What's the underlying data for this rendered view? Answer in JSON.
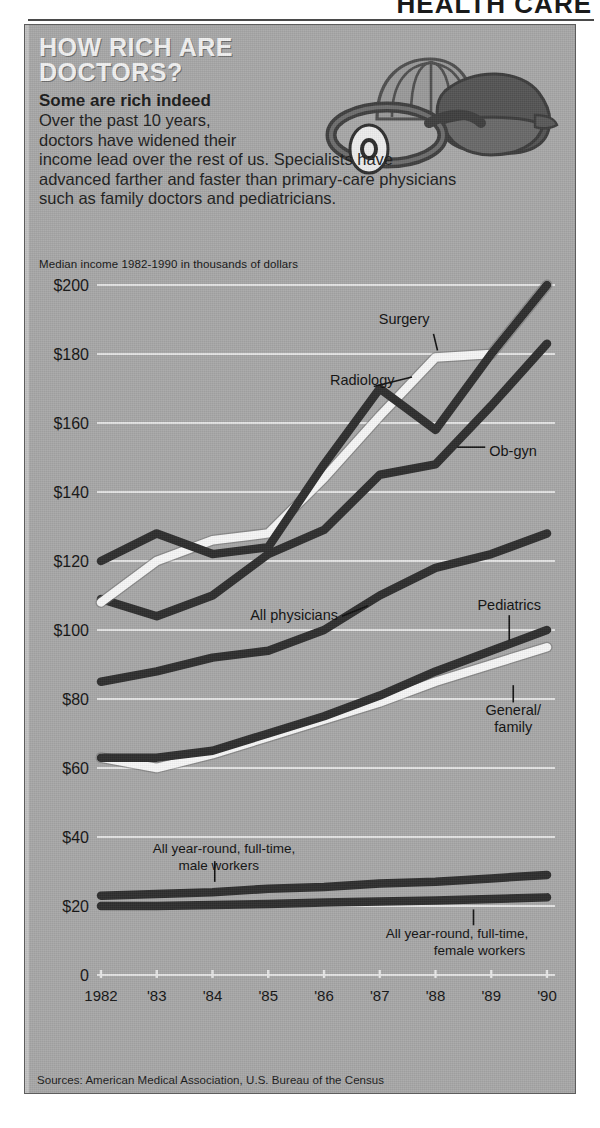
{
  "masthead": {
    "text": "HEALTH CARE"
  },
  "headline": {
    "line1": "HOW RICH ARE",
    "line2": "DOCTORS?"
  },
  "subhead": "Some are rich indeed",
  "deck": {
    "l1": "Over the past 10 years,",
    "l2": "doctors have widened their",
    "l3": "income lead over the rest of us.  Specialists have",
    "l4": "advanced farther and faster than primary-care physicians",
    "l5": "such as family doctors and pediatricians."
  },
  "chart_note": "Median income 1982-1990 in thousands of dollars",
  "sources": "Sources: American Medical Association, U.S. Bureau of the Census",
  "illustration": {
    "name": "stethoscope-and-doctors-bag"
  },
  "colors": {
    "panel_bg": "#a8a8a8",
    "dark_line": "#2e2e2e",
    "light_line": "#f7f7f7",
    "gridline": "#e8e8e8",
    "text": "#141414",
    "headline": "#f2f2f2"
  },
  "chart_data": {
    "type": "line",
    "title": "How rich are doctors?",
    "subtitle": "Median income 1982-1990 in thousands of dollars",
    "xlabel": "",
    "ylabel": "Median income (thousands of dollars)",
    "x": [
      1982,
      1983,
      1984,
      1985,
      1986,
      1987,
      1988,
      1989,
      1990
    ],
    "categories": [
      "1982",
      "'83",
      "'84",
      "'85",
      "'86",
      "'87",
      "'88",
      "'89",
      "'90"
    ],
    "ylim": [
      0,
      200
    ],
    "yticks": [
      0,
      20,
      40,
      60,
      80,
      100,
      120,
      140,
      160,
      180,
      200
    ],
    "ytick_labels": [
      "0",
      "$20",
      "$40",
      "$60",
      "$80",
      "$100",
      "$120",
      "$140",
      "$160",
      "$180",
      "$200"
    ],
    "grid": true,
    "legend": "inline-labels",
    "series": [
      {
        "name": "Radiology",
        "style": "dark",
        "values": [
          120,
          128,
          122,
          124,
          148,
          170,
          158,
          180,
          200
        ]
      },
      {
        "name": "Surgery",
        "style": "light",
        "values": [
          108,
          120,
          126,
          128,
          144,
          162,
          179,
          180,
          200
        ]
      },
      {
        "name": "Ob-gyn",
        "style": "dark",
        "values": [
          109,
          104,
          110,
          122,
          129,
          145,
          148,
          165,
          183
        ]
      },
      {
        "name": "All physicians",
        "style": "dark",
        "values": [
          85,
          88,
          92,
          94,
          100,
          110,
          118,
          122,
          128
        ]
      },
      {
        "name": "Pediatrics",
        "style": "dark",
        "values": [
          63,
          63,
          65,
          70,
          75,
          81,
          88,
          94,
          100
        ]
      },
      {
        "name": "General/family",
        "style": "light",
        "values": [
          63,
          60,
          64,
          69,
          74,
          79,
          85,
          90,
          95
        ]
      },
      {
        "name": "All year-round, full-time, male workers",
        "style": "dark",
        "values": [
          23,
          23.5,
          24,
          25,
          25.5,
          26.5,
          27,
          28,
          29
        ]
      },
      {
        "name": "All year-round, full-time, female workers",
        "style": "dark",
        "values": [
          20,
          20,
          20.3,
          20.6,
          21,
          21.3,
          21.6,
          22,
          22.5
        ]
      }
    ],
    "annotations": [
      {
        "text": "Surgery",
        "series": "Surgery"
      },
      {
        "text": "Radiology",
        "series": "Radiology"
      },
      {
        "text": "Ob-gyn",
        "series": "Ob-gyn"
      },
      {
        "text": "All physicians",
        "series": "All physicians"
      },
      {
        "text": "Pediatrics",
        "series": "Pediatrics"
      },
      {
        "text": "General/",
        "series": "General/family"
      },
      {
        "text": "family",
        "series": "General/family"
      },
      {
        "text": "All year-round, full-time,",
        "series": "All year-round, full-time, male workers"
      },
      {
        "text": "male workers",
        "series": "All year-round, full-time, male workers"
      },
      {
        "text": "All year-round, full-time,",
        "series": "All year-round, full-time, female workers"
      },
      {
        "text": "female workers",
        "series": "All year-round, full-time, female workers"
      }
    ]
  }
}
